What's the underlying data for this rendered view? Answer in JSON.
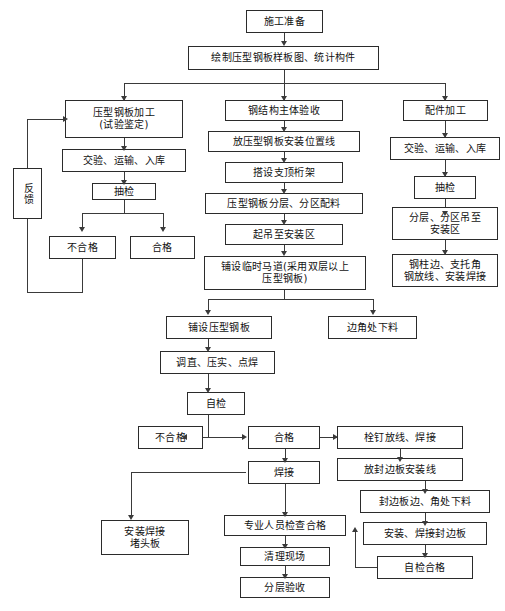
{
  "diagram": {
    "type": "flowchart",
    "orientation": "top-down",
    "colors": {
      "background": "#ffffff",
      "box_border": "#2b2b2b",
      "box_fill": "#ffffff",
      "connector": "#3a3a3a",
      "text": "#111111"
    },
    "nodes": {
      "n01": "施工准备",
      "n02": "绘制压型钢板样板图、统计构件",
      "n03": "压型钢板加工\n(试验鉴定)",
      "n04": "交验、运输、入库",
      "n05": "抽检",
      "n06": "不合格",
      "n07": "合格",
      "n08": "反馈",
      "n09": "钢结构主体验收",
      "n10": "放压型钢板安装位置线",
      "n11": "搭设支顶桁架",
      "n12": "压型钢板分层、分区配料",
      "n13": "起吊至安装区",
      "n14": "铺设临时马道(采用双层以上\n压型钢板)",
      "n15": "铺设压型钢板",
      "n16": "边角处下料",
      "n17": "调直、压实、点焊",
      "n18": "自检",
      "n19": "不合格",
      "n20": "合格",
      "n21": "焊接",
      "n22": "安装焊接\n堵头板",
      "n23": "专业人员检查合格",
      "n24": "清理现场",
      "n25": "分层验收",
      "n26": "配件加工",
      "n27": "交验、运输、入库",
      "n28": "抽检",
      "n29": "分层、分区吊至\n安装区",
      "n30": "钢柱边、支托角\n钢放线、安装焊接",
      "n31": "栓钉放线、焊接",
      "n32": "放封边板安装线",
      "n33": "封边板边、角处下料",
      "n34": "安装、焊接封边板",
      "n35": "自检合格"
    },
    "columns": {
      "left": "压型钢板加工支线",
      "middle": "主体安装支线",
      "right": "配件加工支线"
    },
    "edges": [
      "施工准备 → 绘制压型钢板样板图、统计构件",
      "绘制压型钢板样板图、统计构件 → 压型钢板加工(试验鉴定)",
      "绘制压型钢板样板图、统计构件 → 钢结构主体验收",
      "绘制压型钢板样板图、统计构件 → 配件加工",
      "压型钢板加工(试验鉴定) → 交验、运输、入库",
      "交验、运输、入库 → 抽检",
      "抽检 → 不合格",
      "抽检 → 合格",
      "不合格 → 反馈",
      "反馈 → 压型钢板加工(试验鉴定)",
      "钢结构主体验收 → 放压型钢板安装位置线",
      "放压型钢板安装位置线 → 搭设支顶桁架",
      "搭设支顶桁架 → 压型钢板分层、分区配料",
      "压型钢板分层、分区配料 → 起吊至安装区",
      "起吊至安装区 → 铺设临时马道(采用双层以上压型钢板)",
      "铺设临时马道 → 铺设压型钢板",
      "铺设临时马道 → 边角处下料",
      "铺设压型钢板 → 调直、压实、点焊",
      "调直、压实、点焊 → 自检",
      "自检 → 不合格",
      "自检 → 合格",
      "合格 → 焊接",
      "合格 → 栓钉放线、焊接",
      "焊接 → 安装焊接堵头板",
      "焊接 → 专业人员检查合格",
      "专业人员检查合格 → 清理现场",
      "清理现场 → 分层验收",
      "配件加工 → 交验、运输、入库",
      "交验、运输、入库 → 抽检",
      "抽检 → 分层、分区吊至安装区",
      "分层、分区吊至安装区 → 钢柱边、支托角钢放线、安装焊接",
      "栓钉放线、焊接 → 放封边板安装线",
      "放封边板安装线 → 封边板边、角处下料",
      "封边板边、角处下料 → 安装、焊接封边板",
      "安装、焊接封边板 → 自检合格",
      "自检合格 → 专业人员检查合格"
    ]
  }
}
